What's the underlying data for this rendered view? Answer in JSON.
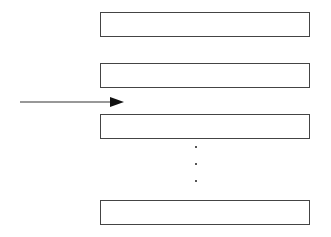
{
  "diagram": {
    "type": "stack-of-blocks-with-input-arrow",
    "boxes": [
      {
        "id": "box-1",
        "label": "",
        "top": 12
      },
      {
        "id": "box-2",
        "label": "",
        "top": 63
      },
      {
        "id": "box-3",
        "label": "",
        "top": 114
      },
      {
        "id": "box-n",
        "label": "",
        "top": 200
      }
    ],
    "ellipsis": {
      "orientation": "vertical",
      "count": 3
    },
    "arrow": {
      "direction": "right",
      "points_to": "gap between box-2 and box-3"
    },
    "colors": {
      "stroke": "#444444",
      "background": "#ffffff"
    }
  }
}
